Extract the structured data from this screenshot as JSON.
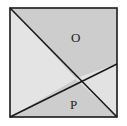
{
  "diagram": {
    "type": "square-partition",
    "labels": {
      "region_top": "O",
      "region_bottom": "P"
    },
    "colors": {
      "background": "#ffffff",
      "dark_region": "#cdcdcd",
      "light_region": "#e3e3e3",
      "stroke": "#1a1a1a"
    }
  }
}
